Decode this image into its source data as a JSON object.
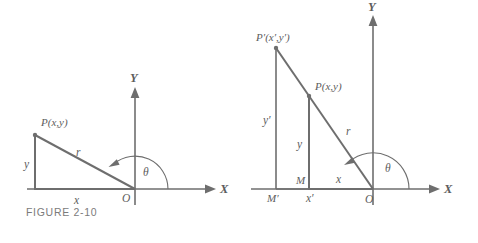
{
  "page": {
    "background_color": "#ffffff",
    "line_color": "#6e6e6e",
    "label_color": "#5d5d5d",
    "caption_color": "#7b7b7b"
  },
  "figures": [
    {
      "id": "figure-2-10",
      "caption": "FIGURE 2-10",
      "axes": {
        "x_label": "X",
        "y_label": "Y",
        "origin_label": "O"
      },
      "points": [
        {
          "name": "P",
          "label": "P(x,y)"
        }
      ],
      "segments": [
        {
          "name": "vertical-leg",
          "label": "y"
        },
        {
          "name": "horizontal-leg",
          "label": "x"
        },
        {
          "name": "hypotenuse",
          "label": "r"
        }
      ],
      "angle": {
        "name": "theta",
        "label": "θ"
      }
    },
    {
      "id": "figure-2-11",
      "caption": "FIGURE 2-11",
      "axes": {
        "x_label": "X",
        "y_label": "Y",
        "origin_label": "O"
      },
      "points": [
        {
          "name": "P-prime",
          "label": "P′(x′,y′)"
        },
        {
          "name": "P",
          "label": "P(x,y)"
        },
        {
          "name": "M",
          "label": "M"
        },
        {
          "name": "M-prime",
          "label": "M′"
        }
      ],
      "segments": [
        {
          "name": "outer-vertical-leg",
          "label": "y′"
        },
        {
          "name": "inner-vertical-leg",
          "label": "y"
        },
        {
          "name": "inner-horizontal-leg",
          "label": "x"
        },
        {
          "name": "outer-horizontal-leg",
          "label": "x′"
        },
        {
          "name": "hypotenuse",
          "label": "r"
        }
      ],
      "angle": {
        "name": "theta",
        "label": "θ"
      }
    }
  ]
}
